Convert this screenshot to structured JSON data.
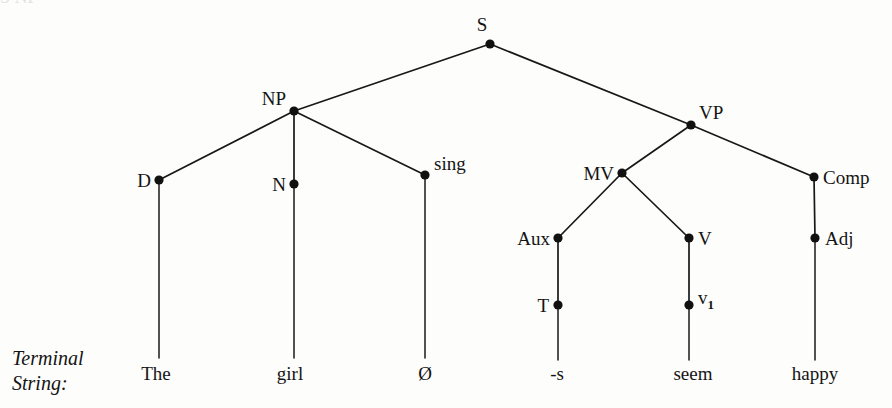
{
  "figure": {
    "kind": "syntax-tree",
    "caption_line_1": "Terminal",
    "caption_line_2": "String:",
    "background_color": "#fdfdfc",
    "ink_color": "#141414",
    "top_bleed_text": "S  NP"
  },
  "nodes": {
    "s": {
      "label": "S",
      "x": 490,
      "y": 44,
      "label_x": 482,
      "label_y": 31,
      "anchor": "middle"
    },
    "np": {
      "label": "NP",
      "x": 294,
      "y": 111,
      "label_x": 286,
      "label_y": 105,
      "anchor": "end"
    },
    "vp": {
      "label": "VP",
      "x": 691,
      "y": 125,
      "label_x": 699,
      "label_y": 119,
      "anchor": "start"
    },
    "d": {
      "label": "D",
      "x": 159,
      "y": 180,
      "label_x": 151,
      "label_y": 187,
      "anchor": "end"
    },
    "n": {
      "label": "N",
      "x": 294,
      "y": 184,
      "label_x": 286,
      "label_y": 191,
      "anchor": "end"
    },
    "sing": {
      "label": "sing",
      "x": 425,
      "y": 175,
      "label_x": 434,
      "label_y": 170,
      "anchor": "start"
    },
    "mv": {
      "label": "MV",
      "x": 622,
      "y": 173,
      "label_x": 614,
      "label_y": 180,
      "anchor": "end"
    },
    "comp": {
      "label": "Comp",
      "x": 814,
      "y": 177,
      "label_x": 823,
      "label_y": 184,
      "anchor": "start"
    },
    "aux": {
      "label": "Aux",
      "x": 558,
      "y": 238,
      "label_x": 550,
      "label_y": 245,
      "anchor": "end"
    },
    "v": {
      "label": "V",
      "x": 689,
      "y": 238,
      "label_x": 698,
      "label_y": 245,
      "anchor": "start"
    },
    "adj": {
      "label": "Adj",
      "x": 815,
      "y": 238,
      "label_x": 825,
      "label_y": 245,
      "anchor": "start"
    },
    "t": {
      "label": "T",
      "x": 558,
      "y": 305,
      "label_x": 549,
      "label_y": 312,
      "anchor": "end"
    },
    "v1": {
      "label": "v",
      "subscript": "1",
      "x": 689,
      "y": 305,
      "label_x": 698,
      "label_y": 304,
      "anchor": "start"
    }
  },
  "edges": [
    {
      "name": "s-to-np",
      "from": "s",
      "to": "np"
    },
    {
      "name": "s-to-vp",
      "from": "s",
      "to": "vp"
    },
    {
      "name": "np-to-d",
      "from": "np",
      "to": "d"
    },
    {
      "name": "np-to-n",
      "from": "np",
      "to": "n"
    },
    {
      "name": "np-to-sing",
      "from": "np",
      "to": "sing"
    },
    {
      "name": "vp-to-mv",
      "from": "vp",
      "to": "mv"
    },
    {
      "name": "vp-to-comp",
      "from": "vp",
      "to": "comp"
    },
    {
      "name": "mv-to-aux",
      "from": "mv",
      "to": "aux"
    },
    {
      "name": "mv-to-v",
      "from": "mv",
      "to": "v"
    },
    {
      "name": "comp-to-adj",
      "from": "comp",
      "to": "adj"
    },
    {
      "name": "aux-to-t",
      "from": "aux",
      "to": "t"
    },
    {
      "name": "v-to-v1",
      "from": "v",
      "to": "v1"
    }
  ],
  "terminals": [
    {
      "name": "terminal-the",
      "text": "The",
      "x": 156,
      "y": 380,
      "stem_from": "d",
      "stem_to_y": 358
    },
    {
      "name": "terminal-girl",
      "text": "girl",
      "x": 290,
      "y": 380,
      "stem_from": "n",
      "stem_to_y": 358
    },
    {
      "name": "terminal-zero",
      "text": "Ø",
      "x": 425,
      "y": 380,
      "stem_from": "sing",
      "stem_to_y": 358
    },
    {
      "name": "terminal-s",
      "text": "-s",
      "x": 557,
      "y": 380,
      "stem_from": "t",
      "stem_to_y": 360
    },
    {
      "name": "terminal-seem",
      "text": "seem",
      "x": 693,
      "y": 380,
      "stem_from": "v1",
      "stem_to_y": 360
    },
    {
      "name": "terminal-happy",
      "text": "happy",
      "x": 815,
      "y": 380,
      "stem_from": "adj",
      "stem_to_y": 360
    }
  ],
  "caption": {
    "x": 12,
    "line1_y": 365,
    "line2_y": 390
  }
}
